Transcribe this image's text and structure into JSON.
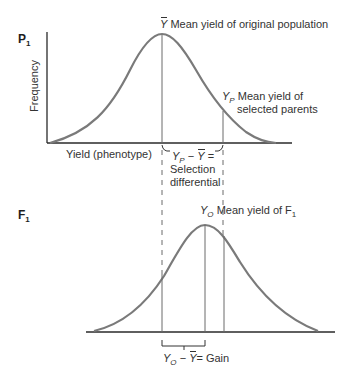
{
  "panels": {
    "p1": {
      "generation_label": "P",
      "generation_sub": "1",
      "y_axis_label": "Frequency",
      "x_axis_label": "Yield (phenotype)",
      "mean_symbol": "Y",
      "mean_label": "Mean yield of original population",
      "selected_symbol": "Y",
      "selected_sub": "P",
      "selected_label_line1": "Mean yield of",
      "selected_label_line2": "selected parents",
      "differential_eq_a": "Y",
      "differential_eq_a_sub": "P",
      "differential_eq_minus": " − ",
      "differential_eq_b": "Y",
      "differential_eq_equals": " =",
      "differential_line1": "Selection",
      "differential_line2": "differential"
    },
    "f1": {
      "generation_label": "F",
      "generation_sub": "1",
      "offspring_symbol": "Y",
      "offspring_sub": "O",
      "offspring_label": "Mean yield of F",
      "offspring_label_sub": "1",
      "gain_eq_a": "Y",
      "gain_eq_a_sub": "O",
      "gain_eq_minus": " − ",
      "gain_eq_b": "Y",
      "gain_eq_rest": "= Gain"
    }
  },
  "colors": {
    "curve": "#7a7a7a",
    "axis": "#2a2a2a",
    "guide": "#6a6a6a",
    "text": "#333333"
  }
}
